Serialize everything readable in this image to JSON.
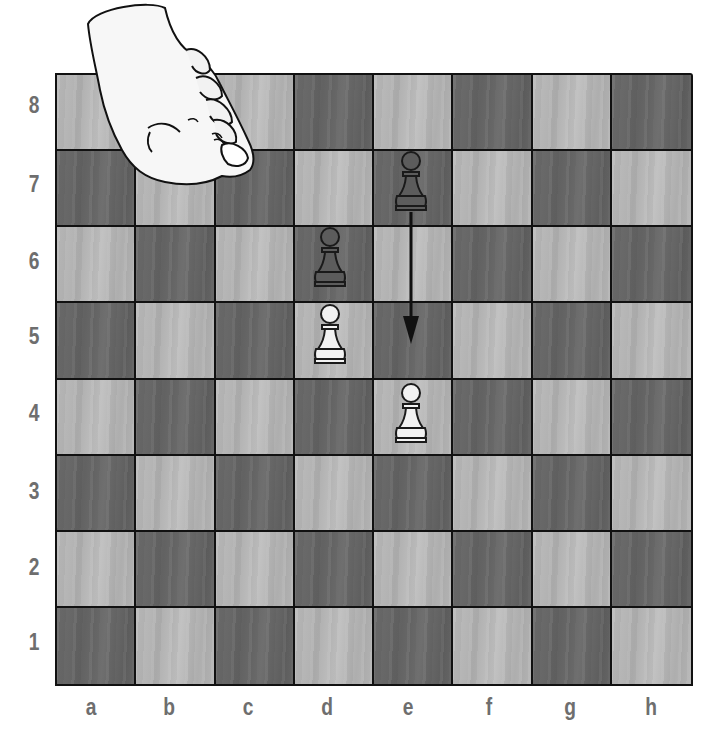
{
  "diagram": {
    "type": "chess-board",
    "orientation": "white-bottom",
    "colors": {
      "light_square": "#b8b8b8",
      "dark_square": "#676767",
      "grid_line": "#111111",
      "label": "#6e6e6e",
      "white_piece": "#f2f2f2",
      "black_piece": "#5a5a5a"
    }
  },
  "labels": {
    "ranks": [
      "8",
      "7",
      "6",
      "5",
      "4",
      "3",
      "2",
      "1"
    ],
    "files": [
      "a",
      "b",
      "c",
      "d",
      "e",
      "f",
      "g",
      "h"
    ]
  },
  "pieces": [
    {
      "square": "e7",
      "type": "pawn",
      "color": "black"
    },
    {
      "square": "d6",
      "type": "pawn",
      "color": "black"
    },
    {
      "square": "d5",
      "type": "pawn",
      "color": "white"
    },
    {
      "square": "e4",
      "type": "pawn",
      "color": "white"
    }
  ],
  "arrows": [
    {
      "from": "e7",
      "to": "e5",
      "description": "black pawn moves two squares forward"
    }
  ],
  "illustration": {
    "hand": "hand-reaching-over-board"
  }
}
